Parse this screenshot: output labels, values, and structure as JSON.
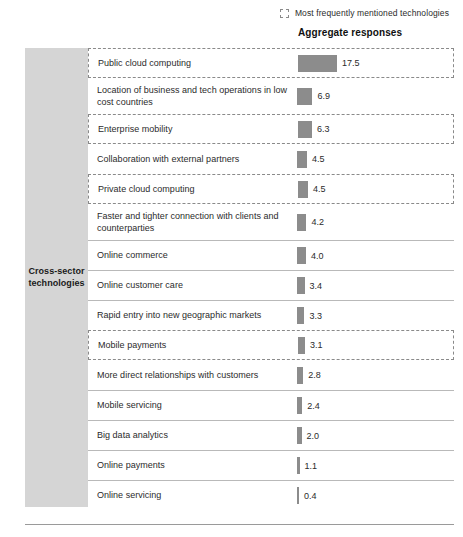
{
  "legend": {
    "swatch_icon": "dashed-square-icon",
    "label": "Most frequently mentioned technologies",
    "swatch_border_color": "#8a8a8a"
  },
  "column_header": "Aggregate responses",
  "category_panel": {
    "label": "Cross-sector technologies",
    "background_color": "#d5d5d5"
  },
  "chart_data": {
    "type": "bar",
    "title": "Aggregate responses",
    "xlabel": "",
    "ylabel": "",
    "orientation": "horizontal",
    "bar_color": "#8c8c8c",
    "grid": false,
    "legend_position": "top-right",
    "xlim": [
      0,
      17.5
    ],
    "categories": [
      "Public cloud computing",
      "Location of business and tech operations in low cost countries",
      "Enterprise mobility",
      "Collaboration with external partners",
      "Private cloud computing",
      "Faster and tighter connection with clients and counterparties",
      "Online commerce",
      "Online customer care",
      "Rapid entry into new geographic markets",
      "Mobile payments",
      "More direct relationships with customers",
      "Mobile servicing",
      "Big data analytics",
      "Online payments",
      "Online servicing"
    ],
    "values": [
      17.5,
      6.9,
      6.3,
      4.5,
      4.5,
      4.2,
      4.0,
      3.4,
      3.3,
      3.1,
      2.8,
      2.4,
      2.0,
      1.1,
      0.4
    ],
    "highlighted": [
      true,
      false,
      true,
      false,
      true,
      false,
      false,
      false,
      false,
      true,
      false,
      false,
      false,
      false,
      false
    ],
    "annotations": [
      "Most frequently mentioned technologies are outlined with a dashed border"
    ]
  },
  "rows": [
    {
      "label": "Public cloud computing",
      "value": "17.5",
      "num": 17.5,
      "highlighted": true,
      "lines": 1
    },
    {
      "label": "Location of business and tech operations in low cost countries",
      "value": "6.9",
      "num": 6.9,
      "highlighted": false,
      "lines": 2
    },
    {
      "label": "Enterprise mobility",
      "value": "6.3",
      "num": 6.3,
      "highlighted": true,
      "lines": 1
    },
    {
      "label": "Collaboration with external partners",
      "value": "4.5",
      "num": 4.5,
      "highlighted": false,
      "lines": 1
    },
    {
      "label": "Private cloud computing",
      "value": "4.5",
      "num": 4.5,
      "highlighted": true,
      "lines": 1
    },
    {
      "label": "Faster and tighter connection with clients and counterparties",
      "value": "4.2",
      "num": 4.2,
      "highlighted": false,
      "lines": 2
    },
    {
      "label": "Online commerce",
      "value": "4.0",
      "num": 4.0,
      "highlighted": false,
      "lines": 1
    },
    {
      "label": "Online customer care",
      "value": "3.4",
      "num": 3.4,
      "highlighted": false,
      "lines": 1
    },
    {
      "label": "Rapid entry into new geographic markets",
      "value": "3.3",
      "num": 3.3,
      "highlighted": false,
      "lines": 1
    },
    {
      "label": "Mobile payments",
      "value": "3.1",
      "num": 3.1,
      "highlighted": true,
      "lines": 1
    },
    {
      "label": "More direct relationships with customers",
      "value": "2.8",
      "num": 2.8,
      "highlighted": false,
      "lines": 1
    },
    {
      "label": "Mobile servicing",
      "value": "2.4",
      "num": 2.4,
      "highlighted": false,
      "lines": 1
    },
    {
      "label": "Big data analytics",
      "value": "2.0",
      "num": 2.0,
      "highlighted": false,
      "lines": 1
    },
    {
      "label": "Online payments",
      "value": "1.1",
      "num": 1.1,
      "highlighted": false,
      "lines": 1
    },
    {
      "label": "Online servicing",
      "value": "0.4",
      "num": 0.4,
      "highlighted": false,
      "lines": 1
    }
  ]
}
